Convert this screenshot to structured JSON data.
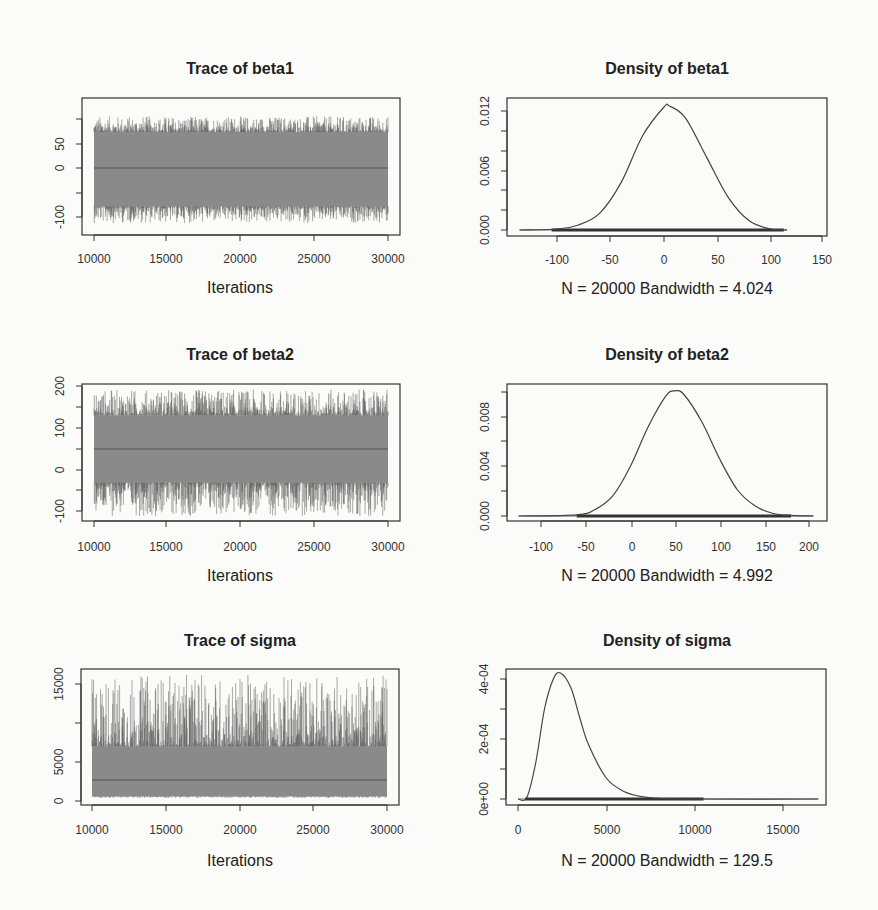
{
  "chart_data": [
    {
      "type": "line",
      "panel": "trace-beta1",
      "title": "Trace of beta1",
      "xlabel": "Iterations",
      "ylabel": "",
      "x_ticks": [
        "10000",
        "15000",
        "20000",
        "25000",
        "30000"
      ],
      "y_ticks": [
        "-100",
        "50",
        "0"
      ],
      "y_tick_values": [
        -100,
        -50,
        0,
        50,
        100
      ],
      "xlim": [
        10000,
        30000
      ],
      "ylim": [
        -120,
        110
      ],
      "series": [
        {
          "name": "beta1 chain",
          "mean": 0,
          "band_low": -80,
          "band_high": 75,
          "spike_min": -115,
          "spike_max": 108
        }
      ]
    },
    {
      "type": "line",
      "panel": "density-beta1",
      "title": "Density of beta1",
      "xlabel": "N = 20000   Bandwidth = 4.024",
      "x_ticks": [
        "-100",
        "-50",
        "0",
        "50",
        "100",
        "150"
      ],
      "y_ticks": [
        "0.000",
        "0.006",
        "0.012"
      ],
      "y_tick_values": [
        0,
        0.002,
        0.004,
        0.006,
        0.008,
        0.01,
        0.012
      ],
      "xlim": [
        -135,
        150
      ],
      "ylim": [
        0,
        0.0128
      ],
      "x": [
        -135,
        -100,
        -80,
        -60,
        -40,
        -20,
        0,
        5,
        20,
        40,
        60,
        80,
        100,
        115
      ],
      "y": [
        0,
        0.0001,
        0.0005,
        0.0017,
        0.0048,
        0.0095,
        0.0124,
        0.0125,
        0.0113,
        0.0073,
        0.0033,
        0.0009,
        0.0001,
        0
      ],
      "N": 20000,
      "bandwidth": 4.024
    },
    {
      "type": "line",
      "panel": "trace-beta2",
      "title": "Trace of beta2",
      "xlabel": "Iterations",
      "x_ticks": [
        "10000",
        "15000",
        "20000",
        "25000",
        "30000"
      ],
      "y_ticks": [
        "-100",
        "0",
        "100",
        "200"
      ],
      "y_tick_values": [
        -100,
        -50,
        0,
        50,
        100,
        150,
        200
      ],
      "xlim": [
        10000,
        30000
      ],
      "ylim": [
        -120,
        205
      ],
      "series": [
        {
          "name": "beta2 chain",
          "mean": 50,
          "band_low": -30,
          "band_high": 130,
          "spike_min": -110,
          "spike_max": 192
        }
      ]
    },
    {
      "type": "line",
      "panel": "density-beta2",
      "title": "Density of beta2",
      "xlabel": "N = 20000   Bandwidth = 4.992",
      "x_ticks": [
        "-100",
        "-50",
        "0",
        "50",
        "100",
        "150",
        "200"
      ],
      "y_ticks": [
        "0.000",
        "0.004",
        "0.008"
      ],
      "y_tick_values": [
        0,
        0.002,
        0.004,
        0.006,
        0.008,
        0.01
      ],
      "xlim": [
        -125,
        210
      ],
      "ylim": [
        0,
        0.0105
      ],
      "x": [
        -125,
        -60,
        -40,
        -20,
        0,
        20,
        40,
        50,
        60,
        80,
        100,
        120,
        140,
        160,
        180,
        205
      ],
      "y": [
        0,
        0.0001,
        0.0005,
        0.0016,
        0.004,
        0.0072,
        0.0097,
        0.0101,
        0.0098,
        0.0076,
        0.0046,
        0.0021,
        0.0008,
        0.0002,
        5e-05,
        0
      ],
      "N": 20000,
      "bandwidth": 4.992
    },
    {
      "type": "line",
      "panel": "trace-sigma",
      "title": "Trace of sigma",
      "xlabel": "Iterations",
      "x_ticks": [
        "10000",
        "15000",
        "20000",
        "25000",
        "30000"
      ],
      "y_ticks": [
        "0",
        "5000",
        "15000"
      ],
      "y_tick_values": [
        0,
        5000,
        10000,
        15000
      ],
      "xlim": [
        10000,
        30000
      ],
      "ylim": [
        0,
        16500
      ],
      "series": [
        {
          "name": "sigma chain",
          "mean": 2700,
          "band_low": 600,
          "band_high": 7000,
          "spike_min": 400,
          "spike_max": 16200
        }
      ]
    },
    {
      "type": "line",
      "panel": "density-sigma",
      "title": "Density of sigma",
      "xlabel": "N = 20000   Bandwidth = 129.5",
      "x_ticks": [
        "0",
        "5000",
        "10000",
        "15000"
      ],
      "y_ticks": [
        "0e+00",
        "2e-04",
        "4e-04"
      ],
      "y_tick_values": [
        0,
        0.0001,
        0.0002,
        0.0003,
        0.0004
      ],
      "xlim": [
        0,
        17000
      ],
      "ylim": [
        0,
        0.00042
      ],
      "x": [
        0,
        500,
        1000,
        1500,
        2000,
        2400,
        3000,
        3500,
        4000,
        5000,
        6000,
        7000,
        8000,
        10000,
        17000
      ],
      "y": [
        0,
        5e-06,
        0.00012,
        0.0003,
        0.0004,
        0.00042,
        0.00037,
        0.00027,
        0.00018,
        7e-05,
        2.5e-05,
        8e-06,
        2e-06,
        0,
        0
      ],
      "N": 20000,
      "bandwidth": 129.5
    }
  ]
}
